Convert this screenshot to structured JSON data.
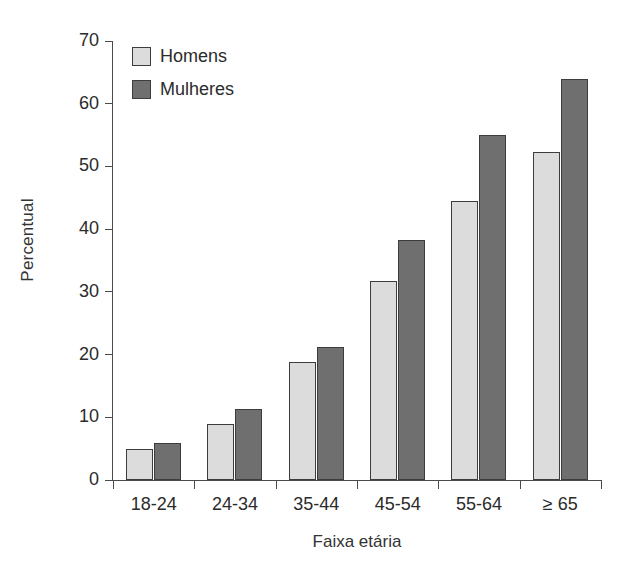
{
  "chart_data": {
    "type": "bar",
    "title": "",
    "xlabel": "Faixa etária",
    "ylabel": "Percentual",
    "categories": [
      "18-24",
      "24-34",
      "35-44",
      "45-54",
      "55-64",
      "≥ 65"
    ],
    "series": [
      {
        "name": "Homens",
        "color": "#dcdcdc",
        "values": [
          5.0,
          8.9,
          18.8,
          31.7,
          44.5,
          52.3
        ]
      },
      {
        "name": "Mulheres",
        "color": "#6f6f6f",
        "values": [
          5.9,
          11.4,
          21.2,
          38.2,
          55.0,
          64.0
        ]
      }
    ],
    "ylim": [
      0,
      70
    ],
    "yticks": [
      0,
      10,
      20,
      30,
      40,
      50,
      60,
      70
    ],
    "ytick_labels": [
      "0",
      "10",
      "20",
      "30",
      "40",
      "50",
      "60",
      "70"
    ],
    "grid": false,
    "legend_position": "top-left"
  }
}
